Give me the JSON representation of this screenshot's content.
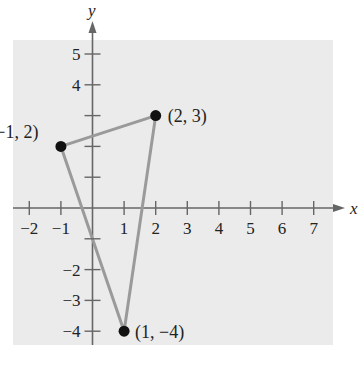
{
  "chart_data": {
    "type": "scatter",
    "title": "",
    "xlabel": "x",
    "ylabel": "y",
    "xlim": [
      -2,
      7
    ],
    "ylim": [
      -4,
      5
    ],
    "grid": false,
    "x_ticks": [
      -2,
      -1,
      1,
      2,
      3,
      4,
      5,
      6,
      7
    ],
    "y_ticks": [
      -4,
      -3,
      -2,
      -1,
      1,
      2,
      3,
      4,
      5
    ],
    "x_tick_labels": [
      "−2",
      "−1",
      "1",
      "2",
      "3",
      "4",
      "5",
      "6",
      "7"
    ],
    "y_tick_labels": [
      "−4",
      "−3",
      "−2",
      "",
      "",
      "",
      "",
      "4",
      "5"
    ],
    "points": [
      {
        "x": -1,
        "y": 2,
        "label": "(−1, 2)"
      },
      {
        "x": 2,
        "y": 3,
        "label": "(2, 3)"
      },
      {
        "x": 1,
        "y": -4,
        "label": "(1, −4)"
      }
    ],
    "polygon": {
      "shape": "triangle",
      "vertices": [
        [
          -1,
          2
        ],
        [
          2,
          3
        ],
        [
          1,
          -4
        ]
      ],
      "closed": true
    },
    "colors": {
      "panel": "#ebebeb",
      "axis": "#666666",
      "edge": "#9a9a9a",
      "point": "#111111"
    }
  }
}
